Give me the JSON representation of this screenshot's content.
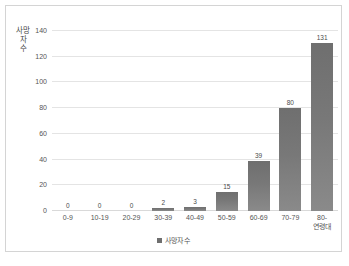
{
  "chart_data": {
    "type": "bar",
    "title": "",
    "xlabel": "",
    "ylabel": "사망자 수",
    "categories": [
      "0-9",
      "10-19",
      "20-29",
      "30-39",
      "40-49",
      "50-59",
      "60-69",
      "70-79",
      "80-\n연령대"
    ],
    "values": [
      0,
      0,
      0,
      2,
      3,
      15,
      39,
      80,
      131
    ],
    "value_labels": [
      "0",
      "0",
      "0",
      "2",
      "3",
      "15",
      "39",
      "80",
      "131"
    ],
    "ylim": [
      0,
      140
    ],
    "yticks": [
      0,
      20,
      40,
      60,
      80,
      100,
      120,
      140
    ],
    "ytick_labels": [
      "0",
      "20",
      "40",
      "60",
      "80",
      "100",
      "120",
      "140"
    ],
    "grid": true,
    "legend": {
      "position": "bottom",
      "entries": [
        "사망자 수"
      ]
    },
    "series": [
      {
        "name": "사망자 수",
        "values": [
          0,
          0,
          0,
          2,
          3,
          15,
          39,
          80,
          131
        ]
      }
    ]
  },
  "style": {
    "bar_color": "#787878",
    "grid_color": "#e4e4e4",
    "text_color": "#555555",
    "border_color": "#d4d4d4",
    "background": "#ffffff"
  }
}
